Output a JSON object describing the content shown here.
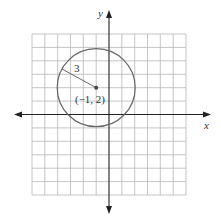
{
  "figure": {
    "axis_labels": {
      "x": "x",
      "y": "y"
    },
    "circle": {
      "center": [
        -1,
        2
      ],
      "radius": 3,
      "center_label": "(−1, 2)",
      "radius_label": "3"
    },
    "grid": {
      "x_range": [
        -7,
        5
      ],
      "y_range": [
        -6,
        6
      ],
      "cell_units": 1
    },
    "colors": {
      "grid": "#b8b8b8",
      "axes": "#222222",
      "circle": "#666666"
    }
  }
}
